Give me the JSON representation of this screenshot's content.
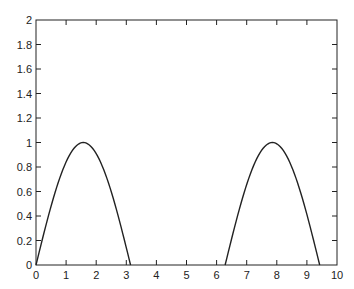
{
  "chart_data": {
    "type": "line",
    "title": "",
    "xlabel": "",
    "ylabel": "",
    "xlim": [
      0,
      10
    ],
    "ylim": [
      0,
      2
    ],
    "grid": false,
    "legend": null,
    "x_ticks": [
      "0",
      "1",
      "2",
      "3",
      "4",
      "5",
      "6",
      "7",
      "8",
      "9",
      "10"
    ],
    "y_ticks": [
      "0",
      "0.2",
      "0.4",
      "0.6",
      "0.8",
      "1",
      "1.2",
      "1.4",
      "1.6",
      "1.8",
      "2"
    ],
    "series": [
      {
        "name": "max(sin(x), 0)",
        "color": "#222222",
        "x": [
          0,
          0.3927,
          0.7854,
          1.1781,
          1.5708,
          1.9635,
          2.3562,
          2.7489,
          3.1416,
          4.0,
          5.0,
          6.2832,
          6.6759,
          7.0686,
          7.4613,
          7.854,
          8.2467,
          8.6394,
          9.0321,
          9.4248
        ],
        "y": [
          0,
          0.383,
          0.707,
          0.924,
          1.0,
          0.924,
          0.707,
          0.383,
          0,
          0,
          0,
          0,
          0.383,
          0.707,
          0.924,
          1.0,
          0.924,
          0.707,
          0.383,
          0
        ]
      }
    ]
  }
}
